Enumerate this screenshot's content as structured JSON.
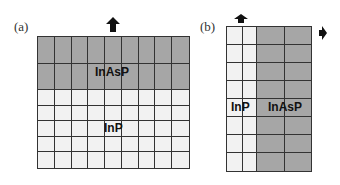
{
  "panels": [
    {
      "id": "a",
      "label": "(a)",
      "regions": [
        {
          "name": "InAsP",
          "position": "top"
        },
        {
          "name": "InP",
          "position": "bottom"
        }
      ],
      "growth_arrow": "up"
    },
    {
      "id": "b",
      "label": "(b)",
      "regions": [
        {
          "name": "InP",
          "position": "left"
        },
        {
          "name": "InAsP",
          "position": "right"
        }
      ],
      "growth_arrows": [
        "up",
        "right"
      ]
    }
  ],
  "colors": {
    "inasp": "#a6a6a6",
    "inp": "#f2f2f2",
    "lines": "#333333"
  }
}
